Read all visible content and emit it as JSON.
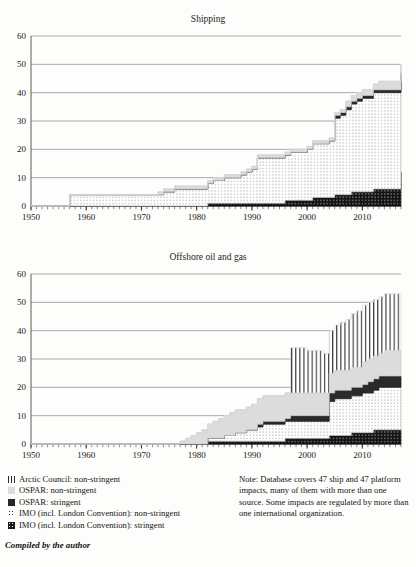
{
  "figure": {
    "cut_off_top_text": "",
    "credit": "Compiled by the author",
    "note": "Note: Database covers 47 ship and 47 platform impacts, many of them with more than one source. Some impacts are regulated by more than one international organization."
  },
  "legend": {
    "items": [
      {
        "swatch": "vertical-lines-pattern",
        "label": "Arctic Council: non-stringent",
        "key": "arctic_non_stringent",
        "color": "#ffffff"
      },
      {
        "swatch": "light-gray-solid",
        "label": "OSPAR: non-stringent",
        "key": "ospar_non_stringent",
        "color": "#dcdcdc"
      },
      {
        "swatch": "dark-solid",
        "label": "OSPAR: stringent",
        "key": "ospar_stringent",
        "color": "#262626"
      },
      {
        "swatch": "fine-dot-pattern",
        "label": "IMO (incl. London Convention): non-stringent",
        "key": "imo_non_stringent",
        "color": "#ffffff"
      },
      {
        "swatch": "dark-dot-pattern",
        "label": "IMO (incl. London Convention): stringent",
        "key": "imo_stringent",
        "color": "#1b1b1b"
      }
    ]
  },
  "chart_data": [
    {
      "type": "area",
      "id": "shipping",
      "title": "Shipping",
      "xlabel": "",
      "ylabel": "",
      "xlim": [
        1950,
        2017
      ],
      "ylim": [
        0,
        60
      ],
      "yticks": [
        0,
        10,
        20,
        30,
        40,
        50,
        60
      ],
      "xticks": [
        1950,
        1960,
        1970,
        1980,
        1990,
        2000,
        2010
      ],
      "xtick_interval_minor": 1,
      "grid": "horizontal",
      "stacked": true,
      "legend_position": "below-figure",
      "x": [
        1950,
        1951,
        1952,
        1953,
        1954,
        1955,
        1956,
        1957,
        1958,
        1959,
        1960,
        1961,
        1962,
        1963,
        1964,
        1965,
        1966,
        1967,
        1968,
        1969,
        1970,
        1971,
        1972,
        1973,
        1974,
        1975,
        1976,
        1977,
        1978,
        1979,
        1980,
        1981,
        1982,
        1983,
        1984,
        1985,
        1986,
        1987,
        1988,
        1989,
        1990,
        1991,
        1992,
        1993,
        1994,
        1995,
        1996,
        1997,
        1998,
        1999,
        2000,
        2001,
        2002,
        2003,
        2004,
        2005,
        2006,
        2007,
        2008,
        2009,
        2010,
        2011,
        2012,
        2013,
        2014,
        2015,
        2016,
        2017
      ],
      "series": [
        {
          "name": "IMO (incl. London Convention): stringent",
          "key": "imo_stringent",
          "pattern": "dark-dot-pattern",
          "values": [
            0,
            0,
            0,
            0,
            0,
            0,
            0,
            0,
            0,
            0,
            0,
            0,
            0,
            0,
            0,
            0,
            0,
            0,
            0,
            0,
            0,
            0,
            0,
            0,
            0,
            0,
            0,
            0,
            0,
            0,
            0,
            0,
            1,
            1,
            1,
            1,
            1,
            1,
            1,
            1,
            1,
            1,
            1,
            1,
            1,
            1,
            2,
            2,
            2,
            2,
            2,
            3,
            3,
            3,
            3,
            4,
            4,
            4,
            5,
            5,
            5,
            5,
            6,
            6,
            6,
            6,
            6,
            12
          ]
        },
        {
          "name": "IMO (incl. London Convention): non-stringent",
          "key": "imo_non_stringent",
          "pattern": "fine-dot-pattern",
          "values": [
            0,
            0,
            0,
            0,
            0,
            0,
            0,
            4,
            4,
            4,
            4,
            4,
            4,
            4,
            4,
            4,
            4,
            4,
            4,
            4,
            4,
            4,
            4,
            4,
            5,
            5,
            6,
            6,
            6,
            6,
            6,
            6,
            7,
            8,
            8,
            9,
            9,
            9,
            10,
            11,
            12,
            16,
            16,
            16,
            16,
            16,
            16,
            17,
            17,
            17,
            18,
            19,
            19,
            19,
            20,
            27,
            28,
            30,
            31,
            32,
            33,
            33,
            34,
            34,
            34,
            34,
            34,
            34
          ]
        },
        {
          "name": "OSPAR: stringent",
          "key": "ospar_stringent",
          "pattern": "dark-solid",
          "values": [
            0,
            0,
            0,
            0,
            0,
            0,
            0,
            0,
            0,
            0,
            0,
            0,
            0,
            0,
            0,
            0,
            0,
            0,
            0,
            0,
            0,
            0,
            0,
            0,
            0,
            0,
            0,
            0,
            0,
            0,
            0,
            0,
            0,
            0,
            0,
            0,
            0,
            0,
            0,
            0,
            0,
            0,
            0,
            0,
            0,
            0,
            0,
            0,
            0,
            0,
            0,
            0,
            0,
            0,
            0,
            1,
            1,
            1,
            1,
            1,
            1,
            1,
            1,
            1,
            1,
            1,
            1,
            1
          ]
        },
        {
          "name": "OSPAR: non-stringent",
          "key": "ospar_non_stringent",
          "pattern": "light-gray-solid",
          "values": [
            0,
            0,
            0,
            0,
            0,
            0,
            0,
            0,
            0,
            0,
            0,
            0,
            0,
            0,
            0,
            0,
            0,
            0,
            0,
            0,
            0,
            0,
            0,
            1,
            1,
            1,
            1,
            1,
            1,
            1,
            1,
            1,
            1,
            1,
            1,
            1,
            1,
            1,
            1,
            1,
            1,
            1,
            1,
            1,
            1,
            1,
            1,
            1,
            1,
            1,
            1,
            1,
            1,
            1,
            1,
            1,
            1,
            2,
            2,
            2,
            2,
            2,
            2,
            3,
            3,
            3,
            3,
            3
          ]
        },
        {
          "name": "Arctic Council: non-stringent",
          "key": "arctic_non_stringent",
          "pattern": "vertical-lines-pattern",
          "values": [
            0,
            0,
            0,
            0,
            0,
            0,
            0,
            0,
            0,
            0,
            0,
            0,
            0,
            0,
            0,
            0,
            0,
            0,
            0,
            0,
            0,
            0,
            0,
            0,
            0,
            0,
            0,
            0,
            0,
            0,
            0,
            0,
            0,
            0,
            0,
            0,
            0,
            0,
            0,
            0,
            0,
            0,
            0,
            0,
            0,
            0,
            0,
            0,
            0,
            0,
            0,
            0,
            0,
            0,
            0,
            0,
            0,
            0,
            0,
            0,
            0,
            0,
            0,
            0,
            0,
            0,
            0,
            0
          ]
        }
      ]
    },
    {
      "type": "area",
      "id": "offshore",
      "title": "Offshore oil and gas",
      "xlabel": "",
      "ylabel": "",
      "xlim": [
        1950,
        2017
      ],
      "ylim": [
        0,
        60
      ],
      "yticks": [
        0,
        10,
        20,
        30,
        40,
        50,
        60
      ],
      "xticks": [
        1950,
        1960,
        1970,
        1980,
        1990,
        2000,
        2010
      ],
      "xtick_interval_minor": 1,
      "grid": "horizontal",
      "stacked": true,
      "legend_position": "below-figure",
      "x": [
        1950,
        1951,
        1952,
        1953,
        1954,
        1955,
        1956,
        1957,
        1958,
        1959,
        1960,
        1961,
        1962,
        1963,
        1964,
        1965,
        1966,
        1967,
        1968,
        1969,
        1970,
        1971,
        1972,
        1973,
        1974,
        1975,
        1976,
        1977,
        1978,
        1979,
        1980,
        1981,
        1982,
        1983,
        1984,
        1985,
        1986,
        1987,
        1988,
        1989,
        1990,
        1991,
        1992,
        1993,
        1994,
        1995,
        1996,
        1997,
        1998,
        1999,
        2000,
        2001,
        2002,
        2003,
        2004,
        2005,
        2006,
        2007,
        2008,
        2009,
        2010,
        2011,
        2012,
        2013,
        2014,
        2015,
        2016,
        2017
      ],
      "series": [
        {
          "name": "IMO (incl. London Convention): stringent",
          "key": "imo_stringent",
          "pattern": "dark-dot-pattern",
          "values": [
            0,
            0,
            0,
            0,
            0,
            0,
            0,
            0,
            0,
            0,
            0,
            0,
            0,
            0,
            0,
            0,
            0,
            0,
            0,
            0,
            0,
            0,
            0,
            0,
            0,
            0,
            0,
            0,
            0,
            0,
            0,
            0,
            1,
            1,
            1,
            1,
            1,
            1,
            1,
            1,
            1,
            1,
            1,
            1,
            1,
            1,
            2,
            2,
            2,
            2,
            2,
            2,
            2,
            2,
            3,
            3,
            3,
            3,
            4,
            4,
            4,
            4,
            5,
            5,
            5,
            5,
            5,
            5
          ]
        },
        {
          "name": "IMO (incl. London Convention): non-stringent",
          "key": "imo_non_stringent",
          "pattern": "fine-dot-pattern",
          "values": [
            0,
            0,
            0,
            0,
            0,
            0,
            0,
            0,
            0,
            0,
            0,
            0,
            0,
            0,
            0,
            0,
            0,
            0,
            0,
            0,
            0,
            0,
            0,
            0,
            0,
            0,
            0,
            0,
            0,
            0,
            0,
            0,
            1,
            1,
            1,
            2,
            2,
            3,
            3,
            4,
            4,
            5,
            6,
            6,
            6,
            6,
            6,
            6,
            6,
            6,
            6,
            6,
            6,
            6,
            12,
            13,
            13,
            13,
            13,
            13,
            14,
            14,
            14,
            15,
            15,
            15,
            15,
            15
          ]
        },
        {
          "name": "OSPAR: stringent",
          "key": "ospar_stringent",
          "pattern": "dark-solid",
          "values": [
            0,
            0,
            0,
            0,
            0,
            0,
            0,
            0,
            0,
            0,
            0,
            0,
            0,
            0,
            0,
            0,
            0,
            0,
            0,
            0,
            0,
            0,
            0,
            0,
            0,
            0,
            0,
            0,
            0,
            0,
            0,
            0,
            0,
            0,
            0,
            0,
            0,
            0,
            0,
            0,
            0,
            1,
            1,
            1,
            1,
            1,
            1,
            2,
            2,
            2,
            2,
            2,
            2,
            2,
            3,
            3,
            3,
            3,
            3,
            3,
            3,
            4,
            4,
            4,
            4,
            4,
            4,
            4
          ]
        },
        {
          "name": "OSPAR: non-stringent",
          "key": "ospar_non_stringent",
          "pattern": "light-gray-solid",
          "values": [
            0,
            0,
            0,
            0,
            0,
            0,
            0,
            0,
            0,
            0,
            0,
            0,
            0,
            0,
            0,
            0,
            0,
            0,
            0,
            0,
            0,
            0,
            0,
            0,
            0,
            0,
            0,
            1,
            2,
            3,
            4,
            5,
            5,
            6,
            7,
            7,
            8,
            8,
            8,
            8,
            9,
            9,
            9,
            9,
            9,
            9,
            9,
            8,
            8,
            8,
            8,
            8,
            8,
            8,
            7,
            7,
            7,
            7,
            7,
            7,
            8,
            8,
            8,
            8,
            9,
            9,
            9,
            9
          ]
        },
        {
          "name": "Arctic Council: non-stringent",
          "key": "arctic_non_stringent",
          "pattern": "vertical-lines-pattern",
          "values": [
            0,
            0,
            0,
            0,
            0,
            0,
            0,
            0,
            0,
            0,
            0,
            0,
            0,
            0,
            0,
            0,
            0,
            0,
            0,
            0,
            0,
            0,
            0,
            0,
            0,
            0,
            0,
            0,
            0,
            0,
            0,
            0,
            0,
            0,
            0,
            0,
            0,
            0,
            0,
            0,
            0,
            0,
            0,
            0,
            0,
            0,
            0,
            16,
            16,
            16,
            15,
            15,
            15,
            14,
            15,
            16,
            17,
            18,
            19,
            20,
            20,
            20,
            20,
            20,
            20,
            20,
            20,
            20
          ]
        }
      ]
    }
  ]
}
